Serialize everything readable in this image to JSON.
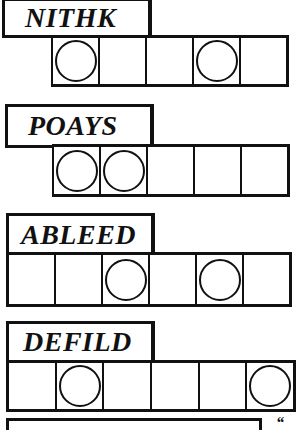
{
  "puzzles": [
    {
      "scrambled": "NITHK",
      "slots": 5,
      "circled": [
        1,
        4
      ]
    },
    {
      "scrambled": "POAYS",
      "slots": 5,
      "circled": [
        1,
        2
      ]
    },
    {
      "scrambled": "ABLEED",
      "slots": 6,
      "circled": [
        3,
        5
      ]
    },
    {
      "scrambled": "DEFILD",
      "slots": 6,
      "circled": [
        2,
        6
      ]
    }
  ],
  "partial_mark": "“"
}
